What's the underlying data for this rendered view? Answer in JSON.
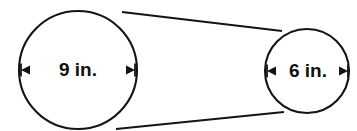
{
  "figure": {
    "name": "two-pulley-belt-diagram",
    "background_color": "#ffffff",
    "line_color": "#141414",
    "text_color": "#111111"
  },
  "shapes": {
    "large_circle": {
      "name": "large-circle",
      "center_x": 78,
      "center_y": 70,
      "radius": 59,
      "stroke_width": 2.1,
      "diameter_label": "9 in.",
      "label_font_size": 19,
      "arrow_y": 70,
      "arrow_left_x": 21,
      "arrow_right_x": 135,
      "label_x": 78
    },
    "small_circle": {
      "name": "small-circle",
      "center_x": 307,
      "center_y": 71,
      "radius": 42,
      "stroke_width": 2.1,
      "diameter_label": "6 in.",
      "label_font_size": 19,
      "arrow_y": 71,
      "arrow_left_x": 267,
      "arrow_right_x": 348,
      "label_x": 308
    }
  },
  "tangent_lines": [
    {
      "name": "upper-tangent-belt-line",
      "x1": 122,
      "y1": 12,
      "x2": 282,
      "y2": 31,
      "stroke_width": 1.9
    },
    {
      "name": "lower-tangent-belt-line",
      "x1": 116,
      "y1": 129,
      "x2": 284,
      "y2": 112,
      "stroke_width": 1.9
    }
  ],
  "arrow_style": {
    "shaft_width": 1.8,
    "head_length": 9,
    "head_half_height": 4.5,
    "cap_height": 13,
    "cap_width": 1.8
  }
}
